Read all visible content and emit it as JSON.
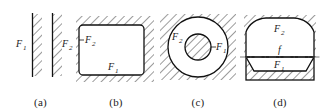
{
  "figure": {
    "background_color": "#ffffff",
    "line_color": "#111111",
    "hatch_color": "#3a3a3a",
    "centerline_color": "#555555",
    "panels": [
      {
        "id": "a",
        "caption": "(a)",
        "description": "two parallel vertical walls with diagonal hatching",
        "labels": [
          {
            "base": "F",
            "sub": "1",
            "position": "left-of-first-wall"
          },
          {
            "base": "F",
            "sub": "2",
            "position": "right-of-second-wall"
          }
        ]
      },
      {
        "id": "b",
        "caption": "(b)",
        "description": "rounded rectangle cavity with external diagonal hatching",
        "labels": [
          {
            "base": "F",
            "sub": "2",
            "position": "inside-left-edge"
          },
          {
            "base": "F",
            "sub": "1",
            "position": "inside-bottom-edge"
          }
        ]
      },
      {
        "id": "c",
        "caption": "(c)",
        "description": "annulus: hatched outer field, clear ring, hatched inner disc",
        "labels": [
          {
            "base": "F",
            "sub": "2",
            "position": "upper-left-of-ring"
          },
          {
            "base": "F",
            "sub": "1",
            "position": "right-of-inner-disc"
          }
        ]
      },
      {
        "id": "d",
        "caption": "(d)",
        "description": "dome over trapezoidal seat with dashed focal centerline",
        "labels": [
          {
            "base": "F",
            "sub": "2",
            "position": "inside-dome"
          },
          {
            "base": "f",
            "sub": "",
            "position": "on-centerline"
          },
          {
            "base": "F",
            "sub": "1",
            "position": "below-centerline"
          }
        ]
      }
    ]
  }
}
